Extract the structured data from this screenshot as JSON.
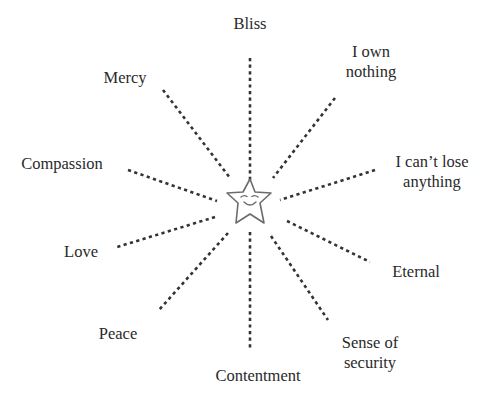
{
  "diagram": {
    "type": "radial-spoke",
    "center": {
      "icon": "smiling-star-icon",
      "x": 250,
      "y": 201
    },
    "colors": {
      "background": "#ffffff",
      "text": "#2a2a2a",
      "spoke": "#333333",
      "star_outline": "#6b6b6b"
    },
    "nodes": [
      {
        "id": "bliss",
        "lines": [
          "Bliss"
        ],
        "label_x": 250,
        "label_y": 24,
        "spoke": [
          250,
          58,
          250,
          182
        ]
      },
      {
        "id": "i-own-nothing",
        "lines": [
          "I own",
          "nothing"
        ],
        "label_x": 371,
        "label_y": 62,
        "spoke": [
          335,
          98,
          273,
          178
        ]
      },
      {
        "id": "i-cant-lose-anything",
        "lines": [
          "I can’t lose",
          "anything"
        ],
        "label_x": 432,
        "label_y": 172,
        "spoke": [
          375,
          170,
          280,
          200
        ]
      },
      {
        "id": "eternal",
        "lines": [
          "Eternal"
        ],
        "label_x": 416,
        "label_y": 272,
        "spoke": [
          287,
          221,
          370,
          262
        ]
      },
      {
        "id": "sense-of-security",
        "lines": [
          "Sense of",
          "security"
        ],
        "label_x": 370,
        "label_y": 353,
        "spoke": [
          271,
          236,
          328,
          320
        ]
      },
      {
        "id": "contentment",
        "lines": [
          "Contentment"
        ],
        "label_x": 258,
        "label_y": 376,
        "spoke": [
          250,
          232,
          250,
          350
        ]
      },
      {
        "id": "peace",
        "lines": [
          "Peace"
        ],
        "label_x": 118,
        "label_y": 334,
        "spoke": [
          228,
          233,
          159,
          310
        ]
      },
      {
        "id": "love",
        "lines": [
          "Love"
        ],
        "label_x": 81,
        "label_y": 252,
        "spoke": [
          215,
          217,
          114,
          248
        ]
      },
      {
        "id": "compassion",
        "lines": [
          "Compassion"
        ],
        "label_x": 62,
        "label_y": 164,
        "spoke": [
          128,
          170,
          217,
          201
        ]
      },
      {
        "id": "mercy",
        "lines": [
          "Mercy"
        ],
        "label_x": 125,
        "label_y": 78,
        "spoke": [
          163,
          90,
          230,
          178
        ]
      }
    ]
  }
}
